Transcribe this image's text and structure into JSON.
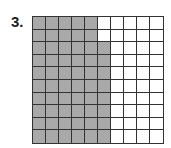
{
  "problem": {
    "number_label": "3.",
    "grid_rows": 10,
    "grid_cols": 10,
    "shaded_per_row": [
      5,
      5,
      6,
      6,
      6,
      6,
      6,
      6,
      6,
      6
    ],
    "shaded_total": 58,
    "colors": {
      "shaded": "#a9a9a9",
      "unshaded": "#ffffff",
      "lines": "#333333"
    }
  }
}
